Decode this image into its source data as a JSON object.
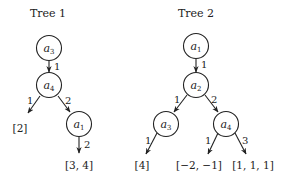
{
  "trees": [
    {
      "title": "Tree 1",
      "nodes": [
        {
          "id": "t1n1",
          "var": "a",
          "sub": "3",
          "x": 49,
          "y": 48
        },
        {
          "id": "t1n2",
          "var": "a",
          "sub": "4",
          "x": 49,
          "y": 86
        },
        {
          "id": "t1n3",
          "var": "a",
          "sub": "1",
          "x": 79,
          "y": 124
        }
      ],
      "edges": [
        {
          "from": "t1n1",
          "to": "t1n2",
          "label": "1"
        },
        {
          "from": "t1n2",
          "to": "leaf:t1l1",
          "label": "1"
        },
        {
          "from": "t1n2",
          "to": "t1n3",
          "label": "2"
        },
        {
          "from": "t1n3",
          "to": "leaf:t1l2",
          "label": "2"
        }
      ],
      "leaves": [
        {
          "id": "t1l1",
          "text": "[2]"
        },
        {
          "id": "t1l2",
          "text": "[3, 4]"
        }
      ]
    },
    {
      "title": "Tree 2",
      "nodes": [
        {
          "id": "t2n1",
          "var": "a",
          "sub": "1"
        },
        {
          "id": "t2n2",
          "var": "a",
          "sub": "2"
        },
        {
          "id": "t2n3",
          "var": "a",
          "sub": "3"
        },
        {
          "id": "t2n4",
          "var": "a",
          "sub": "4"
        }
      ],
      "edges": [
        {
          "from": "t2n1",
          "to": "t2n2",
          "label": "1"
        },
        {
          "from": "t2n2",
          "to": "t2n3",
          "label": "1"
        },
        {
          "from": "t2n2",
          "to": "t2n4",
          "label": "2"
        },
        {
          "from": "t2n3",
          "to": "leaf:t2l1",
          "label": "1"
        },
        {
          "from": "t2n4",
          "to": "leaf:t2l2",
          "label": "1"
        },
        {
          "from": "t2n4",
          "to": "leaf:t2l3",
          "label": "3"
        }
      ],
      "leaves": [
        {
          "id": "t2l1",
          "text": "[4]"
        },
        {
          "id": "t2l2",
          "text": "[−2, −1]"
        },
        {
          "id": "t2l3",
          "text": "[1, 1, 1]"
        }
      ]
    }
  ]
}
